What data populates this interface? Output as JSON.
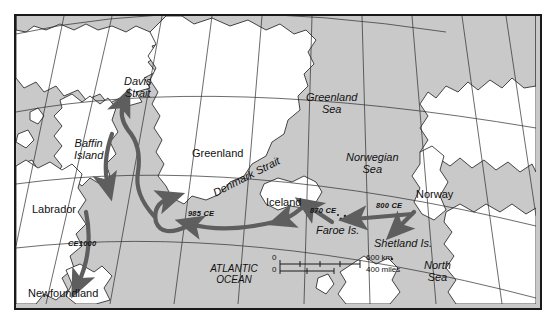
{
  "map": {
    "title": "Norse (Viking) Atlantic expansion routes",
    "colors": {
      "sea": "#c9c9c9",
      "land": "#ffffff",
      "coastline": "#1a1a1a",
      "graticule": "#2b2b2b",
      "route_arrow": "#5e5e5e",
      "frame": "#1a1a1a",
      "text": "#111111"
    },
    "labels": {
      "davis_strait": "Davis\nStrait",
      "davis_strait_line1": "Davis",
      "davis_strait_line2": "Strait",
      "baffin_island_line1": "Baffin",
      "baffin_island_line2": "Island",
      "greenland": "Greenland",
      "greenland_sea_line1": "Greenland",
      "greenland_sea_line2": "Sea",
      "norwegian_sea_line1": "Norwegian",
      "norwegian_sea_line2": "Sea",
      "denmark_strait": "Denmark Strait",
      "iceland": "Iceland",
      "norway": "Norway",
      "labrador": "Labrador",
      "newfoundland": "Newfoundland",
      "faroe_is": "Faroe Is.",
      "shetland_is": "Shetland Is.",
      "north_sea_line1": "North",
      "north_sea_line2": "Sea",
      "atlantic_ocean_line1": "ATLANTIC",
      "atlantic_ocean_line2": "OCEAN"
    },
    "route_dates": {
      "to_greenland": "985 CE",
      "to_iceland": "870 CE",
      "to_faroe_shetland": "800 CE",
      "to_newfoundland": "CE1000"
    },
    "scale_bar": {
      "km_start": "0",
      "km_end": "600 km",
      "miles_start": "0",
      "miles_end": "400 miles"
    }
  }
}
